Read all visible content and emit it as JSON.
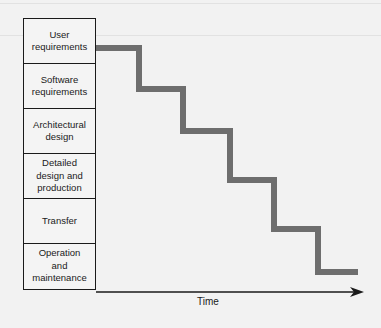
{
  "diagram": {
    "type": "waterfall-lifecycle",
    "phases": [
      {
        "label": "User\nrequirements"
      },
      {
        "label": "Software\nrequirements"
      },
      {
        "label": "Architectural\ndesign"
      },
      {
        "label": "Detailed\ndesign and\nproduction"
      },
      {
        "label": "Transfer"
      },
      {
        "label": "Operation\nand\nmaintenance"
      }
    ],
    "axis_label": "Time",
    "colors": {
      "step_line": "#6e6e6e",
      "box_border": "#1a1a1a",
      "background": "#f2f2f2"
    }
  }
}
